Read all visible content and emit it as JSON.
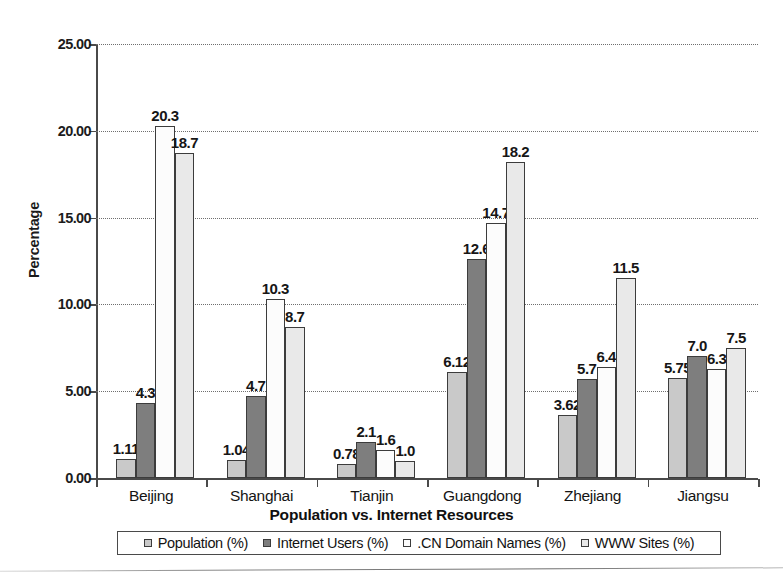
{
  "chart_data": {
    "type": "bar",
    "title": "Population vs. Internet Resources",
    "xlabel": "Population vs. Internet Resources",
    "ylabel": "Percentage",
    "ylim": [
      0,
      25
    ],
    "ytick_labels": [
      "0.00",
      "5.00",
      "10.00",
      "15.00",
      "20.00",
      "25.00"
    ],
    "ytick_values": [
      0,
      5,
      10,
      15,
      20,
      25
    ],
    "grid": true,
    "legend_position": "bottom",
    "categories": [
      "Beijing",
      "Shanghai",
      "Tianjin",
      "Guangdong",
      "Zhejiang",
      "Jiangsu"
    ],
    "series": [
      {
        "name": "Population (%)",
        "color": "#c9c9c9",
        "values": [
          1.11,
          1.04,
          0.78,
          6.12,
          3.62,
          5.75
        ],
        "labels": [
          "1.11",
          "1.04",
          "0.78",
          "6.12",
          "3.62",
          "5.75"
        ]
      },
      {
        "name": "Internet Users (%)",
        "color": "#7e7e7e",
        "values": [
          4.3,
          4.7,
          2.1,
          12.6,
          5.7,
          7.0
        ],
        "labels": [
          "4.3",
          "4.7",
          "2.1",
          "12.6",
          "5.7",
          "7.0"
        ]
      },
      {
        "name": ".CN Domain Names (%)",
        "color": "#fcfcfc",
        "values": [
          20.3,
          10.3,
          1.6,
          14.7,
          6.4,
          6.3
        ],
        "labels": [
          "20.3",
          "10.3",
          "1.6",
          "14.7",
          "6.4",
          "6.3"
        ]
      },
      {
        "name": "WWW Sites (%)",
        "color": "#e9e9e9",
        "values": [
          18.7,
          8.7,
          1.0,
          18.2,
          11.5,
          7.5
        ],
        "labels": [
          "18.7",
          "8.7",
          "1.0",
          "18.2",
          "11.5",
          "7.5"
        ]
      }
    ]
  },
  "legend": {
    "items": [
      {
        "label": "Population (%)",
        "swatch": "#c9c9c9"
      },
      {
        "label": "Internet Users (%)",
        "swatch": "#7e7e7e"
      },
      {
        "label": ".CN Domain Names (%)",
        "swatch": "#fcfcfc"
      },
      {
        "label": "WWW Sites (%)",
        "swatch": "#e9e9e9"
      }
    ]
  }
}
